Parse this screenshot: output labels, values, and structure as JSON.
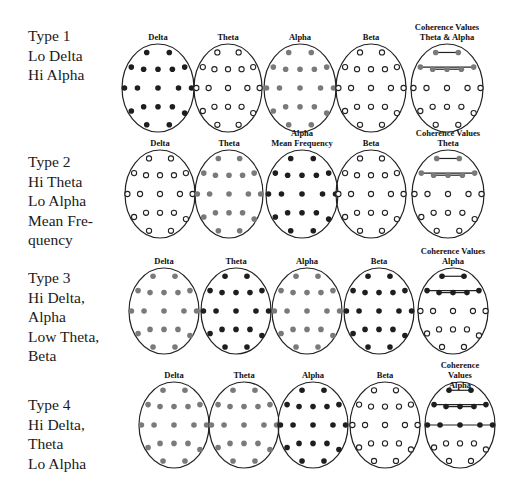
{
  "figure": {
    "colors": {
      "black_dot": "#1e1e1e",
      "gray_dot": "#7a7a7a",
      "open_dot_stroke": "#222222",
      "outline": "#222222"
    },
    "electrode_layout_legend": {
      "filled_black": "high value",
      "filled_gray": "moderate value",
      "open_circle": "low/normal value"
    }
  },
  "rows": [
    {
      "label": "Type 1\nLo Delta\nHi Alpha",
      "label_top": 26,
      "maps": [
        {
          "title": "Delta",
          "fill": "black"
        },
        {
          "title": "Theta",
          "fill": "open"
        },
        {
          "title": "Alpha",
          "fill": "gray"
        },
        {
          "title": "Beta",
          "fill": "open"
        },
        {
          "title": "Coherence Values\nTheta & Alpha",
          "fill": "coherence",
          "coherence_color": "gray",
          "coherence_lines": [
            "top",
            "upper",
            "inner"
          ]
        }
      ]
    },
    {
      "label": "Type 2\nHi Theta\nLo Alpha\nMean Fre-\nquency",
      "label_top": 152,
      "maps": [
        {
          "title": "Delta",
          "fill": "open"
        },
        {
          "title": "Theta",
          "fill": "gray"
        },
        {
          "title": "Alpha\nMean Frequency",
          "fill": "black"
        },
        {
          "title": "Beta",
          "fill": "open"
        },
        {
          "title": "Coherence Values\nTheta",
          "fill": "coherence",
          "coherence_color": "gray",
          "coherence_lines": [
            "top",
            "upper",
            "inner"
          ]
        }
      ]
    },
    {
      "label": "Type 3\nHi Delta,\nAlpha\nLow Theta,\nBeta",
      "label_top": 268,
      "maps": [
        {
          "title": "Delta",
          "fill": "gray"
        },
        {
          "title": "Theta",
          "fill": "black"
        },
        {
          "title": "Alpha",
          "fill": "gray"
        },
        {
          "title": "Beta",
          "fill": "black"
        },
        {
          "title": "Coherence Values\nAlpha",
          "fill": "coherence",
          "coherence_color": "black",
          "coherence_lines": [
            "top",
            "upper",
            "inner"
          ]
        }
      ]
    },
    {
      "label": "Type 4\nHi Delta,\nTheta\nLo Alpha",
      "label_top": 395,
      "maps": [
        {
          "title": "Delta",
          "fill": "gray"
        },
        {
          "title": "Theta",
          "fill": "gray"
        },
        {
          "title": "Alpha",
          "fill": "black"
        },
        {
          "title": "Beta",
          "fill": "open"
        },
        {
          "title": "Coherence Values\nAlpha",
          "fill": "coherence",
          "coherence_color": "black",
          "coherence_lines": [
            "top",
            "upper",
            "inner",
            "middle"
          ]
        }
      ]
    }
  ]
}
